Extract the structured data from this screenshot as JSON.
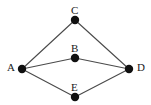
{
  "figure": {
    "name": "undirected-graph-diagram",
    "background_color": "#ffffff",
    "width": 151,
    "height": 105
  },
  "style": {
    "node_color": "#101010",
    "node_radius": 4.2,
    "edge_color": "#4a4a4a",
    "edge_width": 1.1,
    "label_color": "#1a1a1a",
    "label_font_size": 11
  },
  "chart_data": {
    "type": "diagram",
    "title": "",
    "graph_kind": "undirected",
    "nodes": [
      {
        "id": "A",
        "label": "A",
        "x": 22,
        "y": 69,
        "label_x": 7,
        "label_y": 62,
        "label_position": "left"
      },
      {
        "id": "B",
        "label": "B",
        "x": 75,
        "y": 58,
        "label_x": 71,
        "label_y": 43,
        "label_position": "above"
      },
      {
        "id": "C",
        "label": "C",
        "x": 75,
        "y": 20,
        "label_x": 71,
        "label_y": 5,
        "label_position": "above"
      },
      {
        "id": "D",
        "label": "D",
        "x": 129,
        "y": 69,
        "label_x": 137,
        "label_y": 62,
        "label_position": "right"
      },
      {
        "id": "E",
        "label": "E",
        "x": 75,
        "y": 97,
        "label_x": 71,
        "label_y": 82,
        "label_position": "above"
      }
    ],
    "edges": [
      {
        "source": "A",
        "target": "C"
      },
      {
        "source": "C",
        "target": "D"
      },
      {
        "source": "A",
        "target": "B"
      },
      {
        "source": "B",
        "target": "D"
      },
      {
        "source": "A",
        "target": "E"
      },
      {
        "source": "E",
        "target": "D"
      }
    ],
    "node_count": 5,
    "edge_count": 6
  }
}
